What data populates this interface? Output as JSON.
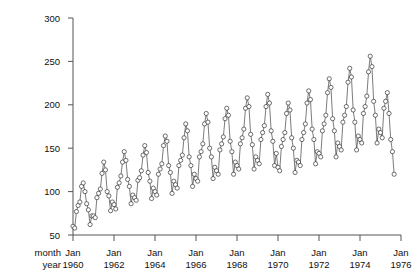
{
  "chart_data": {
    "type": "line",
    "title": "",
    "subtitle": "",
    "xlabel": "",
    "ylabel": "",
    "xlim": [
      1960.0,
      1976.0
    ],
    "ylim": [
      50,
      300
    ],
    "grid": false,
    "legend": null,
    "marker": "open-circle",
    "y_ticks": [
      50,
      100,
      150,
      200,
      250,
      300
    ],
    "y_tick_labels": [
      "50",
      "100",
      "150",
      "200",
      "250",
      "300"
    ],
    "x_tick_values": [
      1960.0,
      1962.0,
      1964.0,
      1966.0,
      1968.0,
      1970.0,
      1972.0,
      1974.0,
      1976.0
    ],
    "x_tick_month_labels": [
      "Jan",
      "Jan",
      "Jan",
      "Jan",
      "Jan",
      "Jan",
      "Jan",
      "Jan",
      "Jan"
    ],
    "x_tick_year_labels": [
      "1960",
      "1962",
      "1964",
      "1966",
      "1968",
      "1970",
      "1972",
      "1974",
      "1976"
    ],
    "x_axis_row_labels": [
      "month",
      "year"
    ],
    "series": [
      {
        "name": "monthly series",
        "x_start": 1960.0,
        "x_step": 0.08333,
        "values": [
          60,
          58,
          77,
          84,
          88,
          106,
          110,
          100,
          86,
          79,
          62,
          72,
          72,
          70,
          93,
          98,
          103,
          121,
          134,
          125,
          100,
          95,
          78,
          88,
          85,
          80,
          105,
          110,
          118,
          134,
          146,
          136,
          114,
          106,
          86,
          96,
          93,
          90,
          113,
          116,
          124,
          142,
          153,
          145,
          122,
          112,
          92,
          104,
          100,
          96,
          120,
          126,
          132,
          153,
          164,
          158,
          130,
          122,
          98,
          112,
          108,
          104,
          130,
          136,
          142,
          162,
          178,
          170,
          140,
          130,
          106,
          120,
          115,
          112,
          140,
          146,
          155,
          178,
          190,
          180,
          150,
          140,
          115,
          128,
          124,
          120,
          148,
          155,
          163,
          184,
          196,
          188,
          158,
          146,
          120,
          134,
          130,
          126,
          155,
          162,
          172,
          196,
          208,
          198,
          166,
          154,
          126,
          140,
          136,
          132,
          160,
          168,
          176,
          198,
          212,
          202,
          170,
          158,
          130,
          144,
          128,
          124,
          152,
          160,
          168,
          190,
          202,
          194,
          162,
          150,
          122,
          136,
          134,
          130,
          160,
          168,
          178,
          202,
          216,
          206,
          172,
          160,
          132,
          146,
          144,
          140,
          170,
          178,
          188,
          214,
          230,
          220,
          184,
          170,
          140,
          156,
          152,
          148,
          180,
          188,
          198,
          226,
          242,
          232,
          194,
          180,
          148,
          164,
          160,
          156,
          190,
          198,
          210,
          238,
          256,
          244,
          204,
          188,
          156,
          172,
          168,
          162,
          196,
          204,
          214,
          190,
          160,
          146,
          120
        ]
      }
    ]
  },
  "axes": {
    "plot_left_px": 73,
    "plot_right_px": 401,
    "plot_top_px": 18,
    "plot_bottom_px": 235
  }
}
